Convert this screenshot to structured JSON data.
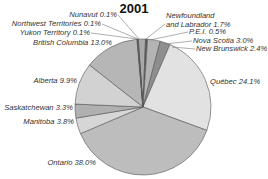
{
  "chart_data": {
    "type": "pie",
    "title": "2001",
    "start_angle_deg": -4,
    "direction": "clockwise",
    "center": [
      143,
      107
    ],
    "radius": 68,
    "slices": [
      {
        "label": "Newfoundland and Labrador",
        "value": 1.7,
        "color": "#a9a9a9"
      },
      {
        "label": "P.E.I.",
        "value": 0.5,
        "color": "#5a5a5a"
      },
      {
        "label": "Nova Scotia",
        "value": 3.0,
        "color": "#b3b3b3"
      },
      {
        "label": "New Brunswick",
        "value": 2.4,
        "color": "#8e8e8e"
      },
      {
        "label": "Québec",
        "value": 24.1,
        "color": "#e2e2e2"
      },
      {
        "label": "Ontario",
        "value": 38.0,
        "color": "#bdbdbd"
      },
      {
        "label": "Manitoba",
        "value": 3.8,
        "color": "#d6d6d6"
      },
      {
        "label": "Saskatchewan",
        "value": 3.3,
        "color": "#b0b0b0"
      },
      {
        "label": "Alberta",
        "value": 9.9,
        "color": "#d2d2d2"
      },
      {
        "label": "British Columbia",
        "value": 13.0,
        "color": "#b6b6b6"
      },
      {
        "label": "Yukon Territory",
        "value": 0.1,
        "color": "#7a7a7a"
      },
      {
        "label": "Northwest Territories",
        "value": 0.1,
        "color": "#606060"
      },
      {
        "label": "Nunavut",
        "value": 0.1,
        "color": "#888888"
      }
    ],
    "labels": [
      {
        "lines": [
          "Nunavut 0.1%"
        ],
        "x": 117,
        "y": 17,
        "anchor": "end",
        "line": [
          118,
          15,
          139,
          39
        ]
      },
      {
        "lines": [
          "Northwest Territories 0.1%"
        ],
        "x": 101,
        "y": 26,
        "anchor": "end",
        "line": [
          102,
          24,
          138,
          39
        ]
      },
      {
        "lines": [
          "Yukon Territory 0.1%"
        ],
        "x": 90,
        "y": 35,
        "anchor": "end",
        "line": [
          91,
          33,
          137,
          39
        ]
      },
      {
        "lines": [
          "British Columbia 13.0%"
        ],
        "x": 112,
        "y": 45,
        "anchor": "end",
        "line": null
      },
      {
        "lines": [
          "Newfoundland",
          "and Labrador 1.7%"
        ],
        "x": 166,
        "y": 18,
        "anchor": "start",
        "line": [
          165,
          24,
          146,
          39
        ]
      },
      {
        "lines": [
          "P.E.I. 0.5%"
        ],
        "x": 189,
        "y": 34,
        "anchor": "start",
        "line": [
          188,
          32,
          150,
          40
        ]
      },
      {
        "lines": [
          "Nova Scotia 3.0%"
        ],
        "x": 193,
        "y": 43,
        "anchor": "start",
        "line": [
          192,
          41,
          165,
          44
        ]
      },
      {
        "lines": [
          "New Brunswick 2.4%"
        ],
        "x": 196,
        "y": 51,
        "anchor": "start",
        "line": [
          195,
          49,
          172,
          47
        ]
      },
      {
        "lines": [
          "Québec 24.1%"
        ],
        "x": 210,
        "y": 84,
        "anchor": "start",
        "line": null
      },
      {
        "lines": [
          "Alberta 9.9%"
        ],
        "x": 77,
        "y": 83,
        "anchor": "end",
        "line": null
      },
      {
        "lines": [
          "Saskatchewan 3.3%"
        ],
        "x": 73,
        "y": 110,
        "anchor": "end",
        "line": null
      },
      {
        "lines": [
          "Manitoba 3.8%"
        ],
        "x": 74,
        "y": 124,
        "anchor": "end",
        "line": null
      },
      {
        "lines": [
          "Ontario 38.0%"
        ],
        "x": 96,
        "y": 165,
        "anchor": "end",
        "line": null
      }
    ]
  }
}
